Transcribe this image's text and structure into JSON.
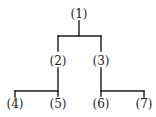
{
  "diagram": {
    "type": "tree",
    "line_color": "#1a1a1a",
    "nodes": [
      {
        "id": "1",
        "label": "(1)",
        "x": 79,
        "y": 7
      },
      {
        "id": "2",
        "label": "(2)",
        "x": 58,
        "y": 54
      },
      {
        "id": "3",
        "label": "(3)",
        "x": 101,
        "y": 54
      },
      {
        "id": "4",
        "label": "(4)",
        "x": 15,
        "y": 97
      },
      {
        "id": "5",
        "label": "(5)",
        "x": 58,
        "y": 97
      },
      {
        "id": "6",
        "label": "(6)",
        "x": 101,
        "y": 97
      },
      {
        "id": "7",
        "label": "(7)",
        "x": 144,
        "y": 97
      }
    ],
    "edges": [
      {
        "from": "1",
        "to": "2"
      },
      {
        "from": "1",
        "to": "3"
      },
      {
        "from": "2",
        "to": "4"
      },
      {
        "from": "2",
        "to": "5"
      },
      {
        "from": "3",
        "to": "6"
      },
      {
        "from": "3",
        "to": "7"
      }
    ]
  }
}
